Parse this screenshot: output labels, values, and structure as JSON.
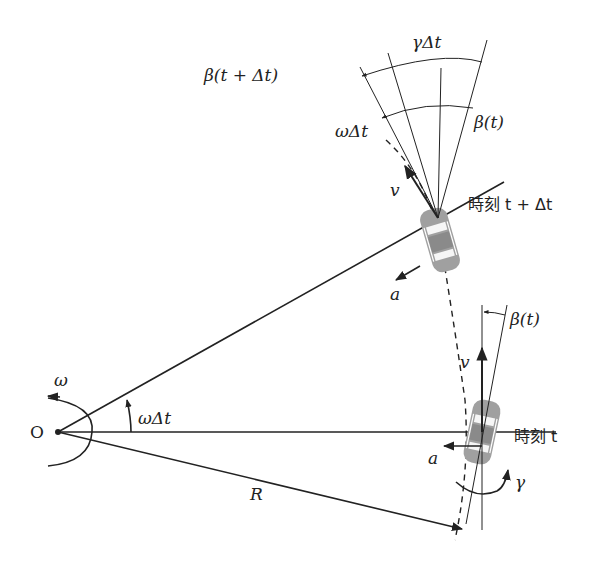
{
  "diagram": {
    "type": "vehicle-kinematics",
    "origin_label": "O",
    "labels": {
      "omega": "ω",
      "omega_dt_origin": "ωΔt",
      "radius": "R",
      "accel_t": "a",
      "accel_t_dt": "a",
      "velocity_t": "v",
      "velocity_t_dt": "v",
      "gamma": "γ",
      "beta_t_lower": "β(t)",
      "beta_t_upper": "β(t)",
      "beta_t_plus_dt": "β(t + Δt)",
      "gamma_dt": "γΔt",
      "omega_dt_upper": "ωΔt",
      "time_t": "時刻 t",
      "time_t_plus_dt": "時刻 t + Δt"
    },
    "colors": {
      "line": "#222222",
      "car_body": "#9a9a9a",
      "car_window": "#ffffff"
    }
  }
}
